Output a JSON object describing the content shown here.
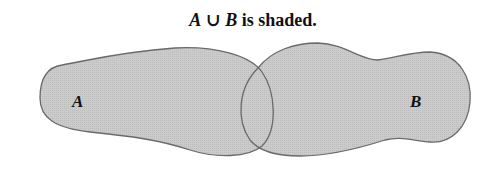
{
  "title": {
    "set_a": "A",
    "union_symbol": "∪",
    "set_b": "B",
    "suffix": "is shaded."
  },
  "diagram": {
    "type": "venn",
    "operation": "union",
    "sets": [
      {
        "name": "A",
        "label": "A",
        "shaded": true
      },
      {
        "name": "B",
        "label": "B",
        "shaded": true
      }
    ],
    "shade_color": "#c9c9c9",
    "outline_color": "#6a6a6a"
  }
}
